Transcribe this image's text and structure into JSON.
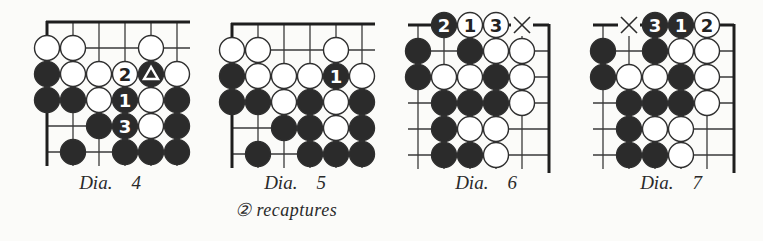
{
  "colors": {
    "background": "#fbfbf9",
    "line": "#3a3a3a",
    "edge": "#1e1e1e",
    "black_stone": "#2b2b2b",
    "white_stone": "#ffffff",
    "stone_outline": "#2f2f2f"
  },
  "legend": {
    "B": "black stone",
    "W": "white stone",
    ".": "empty intersection",
    "X": "marked point (×)"
  },
  "diagrams": [
    {
      "id": "dia4",
      "caption": "Dia.    4",
      "subcaption": "",
      "edges": [
        "top",
        "left"
      ],
      "rows_label": "row 0 is the line just below the top edge",
      "board": [
        [
          "W",
          "W",
          ".",
          ".",
          "W",
          "."
        ],
        [
          "B",
          "W",
          "W",
          "W",
          "B",
          "W"
        ],
        [
          "B",
          "B",
          "W",
          "B",
          "W",
          "B"
        ],
        [
          ".",
          ".",
          "B",
          "B",
          "W",
          "B"
        ],
        [
          ".",
          "B",
          ".",
          "B",
          "B",
          "B"
        ]
      ],
      "marks": [
        {
          "row": 1,
          "col": 3,
          "label": "2"
        },
        {
          "row": 1,
          "col": 4,
          "label": "triangle"
        },
        {
          "row": 2,
          "col": 3,
          "label": "1"
        },
        {
          "row": 3,
          "col": 3,
          "label": "3"
        }
      ]
    },
    {
      "id": "dia5",
      "caption": "Dia.    5",
      "subcaption": "② recaptures",
      "edges": [
        "top",
        "left"
      ],
      "board": [
        [
          "W",
          "W",
          ".",
          ".",
          "W",
          "."
        ],
        [
          "B",
          "W",
          "W",
          "W",
          "B",
          "W"
        ],
        [
          "B",
          "B",
          "W",
          "B",
          "W",
          "B"
        ],
        [
          ".",
          ".",
          "B",
          "B",
          "W",
          "B"
        ],
        [
          ".",
          "B",
          ".",
          "B",
          "B",
          "B"
        ]
      ],
      "marks": [
        {
          "row": 1,
          "col": 4,
          "label": "1"
        }
      ]
    },
    {
      "id": "dia6",
      "caption": "Dia.    6",
      "subcaption": "",
      "edges": [
        "top",
        "right"
      ],
      "board": [
        [
          ".",
          "B",
          "W",
          "W",
          "X"
        ],
        [
          "B",
          ".",
          "B",
          "W",
          "W"
        ],
        [
          "B",
          "W",
          "W",
          "B",
          "W"
        ],
        [
          ".",
          "B",
          "B",
          "B",
          "W"
        ],
        [
          ".",
          "B",
          "W",
          "W",
          "."
        ],
        [
          ".",
          "B",
          "B",
          "W",
          "."
        ]
      ],
      "marks": [
        {
          "row": 0,
          "col": 1,
          "label": "2"
        },
        {
          "row": 0,
          "col": 2,
          "label": "1"
        },
        {
          "row": 0,
          "col": 3,
          "label": "3"
        }
      ]
    },
    {
      "id": "dia7",
      "caption": "Dia.    7",
      "subcaption": "",
      "edges": [
        "top",
        "right"
      ],
      "board": [
        [
          ".",
          "X",
          "B",
          "B",
          "W"
        ],
        [
          "B",
          ".",
          "B",
          "W",
          "W"
        ],
        [
          "B",
          "W",
          "W",
          "B",
          "W"
        ],
        [
          ".",
          "B",
          "B",
          "B",
          "W"
        ],
        [
          ".",
          "B",
          "W",
          "W",
          "."
        ],
        [
          ".",
          "B",
          "B",
          "W",
          "."
        ]
      ],
      "marks": [
        {
          "row": 0,
          "col": 2,
          "label": "3"
        },
        {
          "row": 0,
          "col": 3,
          "label": "1"
        },
        {
          "row": 0,
          "col": 4,
          "label": "2"
        }
      ]
    }
  ]
}
